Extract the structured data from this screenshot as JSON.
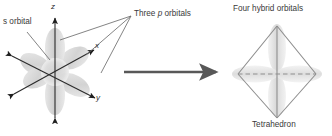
{
  "figure": {
    "type": "diagram",
    "topic": "sp3 orbital hybridization",
    "left_panel": {
      "s_orbital_label": "s orbital",
      "p_orbitals_label_pre": "Three ",
      "p_orbitals_label_italic": "p",
      "p_orbitals_label_post": " orbitals",
      "axes": [
        {
          "name": "z-axis-label",
          "label": "z"
        },
        {
          "name": "x-axis-label",
          "label": "x"
        },
        {
          "name": "y-axis-label",
          "label": "y"
        }
      ]
    },
    "transform_arrow": {
      "name": "transformation-arrow",
      "direction": "right"
    },
    "right_panel": {
      "hybrid_label": "Four hybrid orbitals",
      "shape_label": "Tetrahedron"
    },
    "colors": {
      "text": "#3a3a3a",
      "axis_line": "#2b2b2b",
      "leader_line": "#6e6e6e",
      "arrow": "#585858",
      "orbital_fill": "#d9d9d9",
      "orbital_fill_light": "#eaeaea",
      "tetra_edge": "#8c8c8c",
      "dashed_line": "#8f8f8f",
      "background": "#ffffff"
    }
  }
}
